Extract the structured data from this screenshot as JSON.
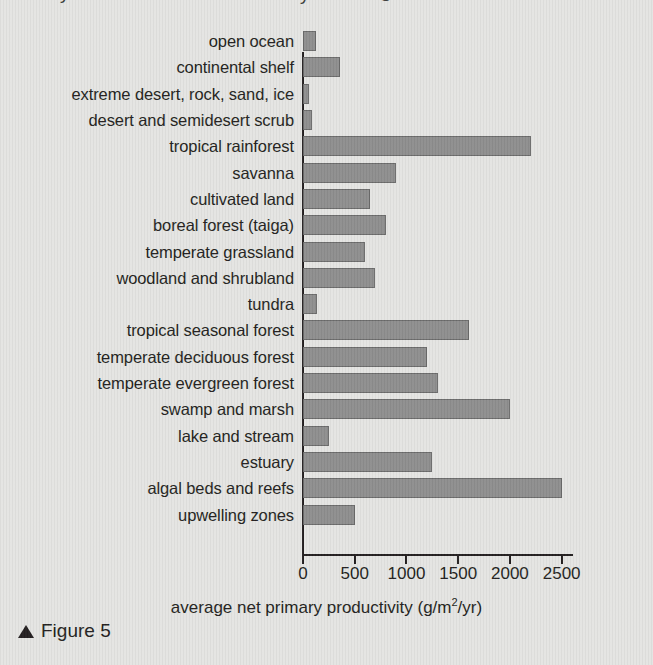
{
  "figure": {
    "caption_marker": "triangle-up",
    "caption_text": "Figure 5"
  },
  "title_remnant": {
    "fragment_left": "y",
    "fragment_mid": "y",
    "fragment_right": "g"
  },
  "chart_data": {
    "type": "bar",
    "orientation": "horizontal",
    "title": "",
    "subtitle": "",
    "xlabel": "average net primary productivity (g/m2/yr)",
    "xlabel_prefix": "average net primary productivity (g/m",
    "xlabel_sup": "2",
    "xlabel_suffix": "/yr)",
    "ylabel": "",
    "grid": false,
    "legend": false,
    "xlim": [
      0,
      2600
    ],
    "xticks": [
      0,
      500,
      1000,
      1500,
      2000,
      2500
    ],
    "xtick_labels": [
      "0",
      "500",
      "1000",
      "1500",
      "2000",
      "2500"
    ],
    "bar_color": "#8e8e8e",
    "bar_border_color": "#6b6b6b",
    "background_color": "#e4e4e2",
    "axis_color": "#231f20",
    "categories": [
      "open ocean",
      "continental shelf",
      "extreme desert, rock, sand, ice",
      "desert and semidesert scrub",
      "tropical rainforest",
      "savanna",
      "cultivated land",
      "boreal forest (taiga)",
      "temperate grassland",
      "woodland and shrubland",
      "tundra",
      "tropical seasonal forest",
      "temperate deciduous forest",
      "temperate evergreen forest",
      "swamp and marsh",
      "lake and stream",
      "estuary",
      "algal beds and reefs",
      "upwelling zones"
    ],
    "values": [
      125,
      360,
      55,
      90,
      2200,
      900,
      650,
      800,
      600,
      700,
      140,
      1600,
      1200,
      1300,
      2000,
      250,
      1250,
      2500,
      500
    ]
  }
}
